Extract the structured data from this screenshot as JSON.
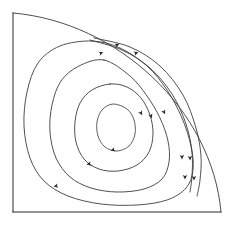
{
  "figure": {
    "background_color": "#ffffff",
    "line_color": "#3d3d3d",
    "wall_color": "#2b2b2b",
    "arrow_color": "#2b2b2b",
    "width": 233,
    "height": 226
  },
  "chart_data": {
    "type": "line",
    "subtitle": "",
    "xlabel": "",
    "ylabel": "",
    "xlim": [
      0,
      233
    ],
    "ylim": [
      0,
      226
    ],
    "grid": false,
    "legend": "none",
    "annotations": [
      {
        "name": "flow-direction",
        "text": "clockwise circulation",
        "visible": false
      }
    ],
    "domain": {
      "name": "quarter-cavity",
      "left_wall": {
        "x": 13,
        "y_start": 13,
        "y_end": 212
      },
      "bottom_wall": {
        "y": 212,
        "x_start": 13,
        "x_end": 221
      },
      "outer_arc": {
        "start": [
          13,
          13
        ],
        "end": [
          221,
          212
        ],
        "control_points": [
          [
            118,
            22
          ],
          [
            212,
            110
          ]
        ]
      }
    },
    "series": [
      {
        "name": "streamline-1-outer",
        "closed": true,
        "level": 0.2,
        "points": [
          [
            92,
            41
          ],
          [
            60,
            46
          ],
          [
            38,
            63
          ],
          [
            27,
            92
          ],
          [
            24,
            126
          ],
          [
            30,
            158
          ],
          [
            44,
            181
          ],
          [
            68,
            196
          ],
          [
            101,
            204
          ],
          [
            137,
            205
          ],
          [
            167,
            200
          ],
          [
            186,
            188
          ],
          [
            193,
            170
          ],
          [
            191,
            146
          ],
          [
            182,
            118
          ],
          [
            167,
            90
          ],
          [
            147,
            66
          ],
          [
            120,
            48
          ],
          [
            92,
            41
          ]
        ]
      },
      {
        "name": "streamline-2",
        "closed": true,
        "level": 0.4,
        "points": [
          [
            104,
            60
          ],
          [
            79,
            66
          ],
          [
            61,
            81
          ],
          [
            52,
            105
          ],
          [
            50,
            132
          ],
          [
            56,
            158
          ],
          [
            70,
            177
          ],
          [
            91,
            188
          ],
          [
            117,
            192
          ],
          [
            144,
            189
          ],
          [
            162,
            179
          ],
          [
            169,
            162
          ],
          [
            168,
            141
          ],
          [
            160,
            118
          ],
          [
            147,
            96
          ],
          [
            130,
            76
          ],
          [
            104,
            60
          ]
        ]
      },
      {
        "name": "streamline-3",
        "closed": true,
        "level": 0.6,
        "points": [
          [
            110,
            84
          ],
          [
            92,
            90
          ],
          [
            80,
            103
          ],
          [
            75,
            122
          ],
          [
            76,
            142
          ],
          [
            84,
            159
          ],
          [
            99,
            169
          ],
          [
            118,
            171
          ],
          [
            137,
            165
          ],
          [
            149,
            152
          ],
          [
            153,
            134
          ],
          [
            150,
            115
          ],
          [
            141,
            98
          ],
          [
            127,
            87
          ],
          [
            110,
            84
          ]
        ]
      },
      {
        "name": "streamline-4-inner",
        "closed": true,
        "level": 0.8,
        "points": [
          [
            113,
            104
          ],
          [
            102,
            110
          ],
          [
            97,
            122
          ],
          [
            98,
            136
          ],
          [
            105,
            147
          ],
          [
            117,
            151
          ],
          [
            129,
            146
          ],
          [
            135,
            134
          ],
          [
            134,
            120
          ],
          [
            127,
            109
          ],
          [
            113,
            104
          ]
        ]
      },
      {
        "name": "streamline-5-boundary-layer-a",
        "closed": false,
        "level": 0.1,
        "points": [
          [
            90,
            40
          ],
          [
            122,
            50
          ],
          [
            150,
            68
          ],
          [
            172,
            94
          ],
          [
            186,
            124
          ],
          [
            192,
            152
          ],
          [
            192,
            176
          ],
          [
            190,
            192
          ]
        ]
      },
      {
        "name": "streamline-6-boundary-layer-b",
        "closed": false,
        "level": 0.05,
        "points": [
          [
            94,
            38
          ],
          [
            130,
            47
          ],
          [
            160,
            66
          ],
          [
            183,
            95
          ],
          [
            196,
            128
          ],
          [
            201,
            156
          ],
          [
            200,
            180
          ],
          [
            197,
            196
          ]
        ]
      }
    ],
    "arrows": [
      {
        "name": "arrow-top-a",
        "x": 101,
        "y": 53,
        "angle": -20,
        "direction": "up-right"
      },
      {
        "name": "arrow-top-b",
        "x": 117,
        "y": 45,
        "angle": -22,
        "direction": "up-right"
      },
      {
        "name": "arrow-top-c",
        "x": 136,
        "y": 53,
        "angle": -18,
        "direction": "up-right"
      },
      {
        "name": "arrow-right-upper-a",
        "x": 151,
        "y": 116,
        "angle": 68,
        "direction": "down-right"
      },
      {
        "name": "arrow-right-upper-b",
        "x": 164,
        "y": 112,
        "angle": 66,
        "direction": "down-right"
      },
      {
        "name": "arrow-right-lower-a",
        "x": 182,
        "y": 157,
        "angle": 88,
        "direction": "down"
      },
      {
        "name": "arrow-right-lower-b",
        "x": 190,
        "y": 158,
        "angle": 88,
        "direction": "down"
      },
      {
        "name": "arrow-right-lower-c",
        "x": 185,
        "y": 177,
        "angle": 90,
        "direction": "down"
      },
      {
        "name": "arrow-right-lower-d",
        "x": 194,
        "y": 178,
        "angle": 90,
        "direction": "down"
      },
      {
        "name": "arrow-inner-a",
        "x": 113,
        "y": 150,
        "angle": 160,
        "direction": "down-left"
      },
      {
        "name": "arrow-mid-a",
        "x": 89,
        "y": 164,
        "angle": 168,
        "direction": "down-left"
      },
      {
        "name": "arrow-outer-a",
        "x": 56,
        "y": 186,
        "angle": 170,
        "direction": "down-left"
      },
      {
        "name": "arrow-inner-b",
        "x": 141,
        "y": 113,
        "angle": 62,
        "direction": "down-right"
      }
    ]
  }
}
